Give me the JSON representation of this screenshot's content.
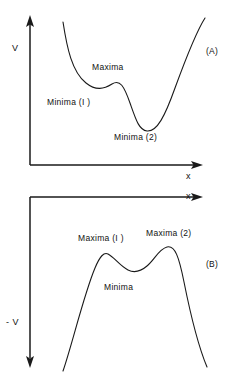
{
  "figure": {
    "background_color": "#ffffff",
    "ink_color": "#1a1a1a",
    "width": 234,
    "height": 378
  },
  "panels": [
    {
      "tag": "(A)",
      "tag_name": "panel-a-tag",
      "y_axis_label": "V",
      "x_axis_label": "x",
      "annotations": [
        {
          "text": "Maxima",
          "name": "panel-a-maxima-label"
        },
        {
          "text": "Minima (I )",
          "name": "panel-a-minima-1-label"
        },
        {
          "text": "Minima (2)",
          "name": "panel-a-minima-2-label"
        }
      ]
    },
    {
      "tag": "(B)",
      "tag_name": "panel-b-tag",
      "y_axis_label": "- V",
      "x_axis_label": "x",
      "annotations": [
        {
          "text": "Maxima (I )",
          "name": "panel-b-maxima-1-label"
        },
        {
          "text": "Maxima (2)",
          "name": "panel-b-maxima-2-label"
        },
        {
          "text": "Minima",
          "name": "panel-b-minima-label"
        }
      ]
    }
  ],
  "chart_data": {
    "type": "line",
    "title": "",
    "subtitle": "",
    "grid": false,
    "legend": false,
    "charts": [
      {
        "id": "panel-a",
        "tag": "(A)",
        "xlabel": "x",
        "ylabel": "V",
        "axis_origin": [
          30,
          165
        ],
        "x_axis_direction": "right",
        "y_axis_direction": "up",
        "description": "Double-well potential V(x): high at left, shallow first minimum, small local maximum, deep second minimum, high at right.",
        "features": [
          {
            "label": "Minima (I )",
            "kind": "local-minimum",
            "x": 95,
            "y": 87
          },
          {
            "label": "Maxima",
            "kind": "local-maximum",
            "x": 112,
            "y": 84
          },
          {
            "label": "Minima (2)",
            "kind": "global-minimum",
            "x": 144,
            "y": 131
          }
        ],
        "path": "M 63 22 C 67 48, 72 72, 86 83 C 96 91, 104 89, 112 84 C 120 79, 124 86, 130 103 C 136 120, 139 130, 147 131 C 157 132, 165 116, 175 88 C 186 58, 196 32, 205 18"
      },
      {
        "id": "panel-b",
        "tag": "(B)",
        "xlabel": "x",
        "ylabel": "- V",
        "axis_origin": [
          30,
          197
        ],
        "x_axis_direction": "right",
        "y_axis_direction": "down",
        "description": "Inverted double-well -V(x): rises from lower-left to first maximum, dips to a minimum, rises to a higher second maximum, then falls to lower-right.",
        "features": [
          {
            "label": "Maxima (I )",
            "kind": "local-maximum",
            "x": 105,
            "y": 253
          },
          {
            "label": "Minima",
            "kind": "local-minimum",
            "x": 134,
            "y": 271
          },
          {
            "label": "Maxima (2)",
            "kind": "global-maximum",
            "x": 166,
            "y": 248
          }
        ],
        "path": "M 63 371 C 72 345, 84 294, 95 268 C 100 256, 104 252, 108 254 C 114 257, 120 266, 128 270 C 134 273, 140 272, 147 266 C 155 259, 159 249, 167 247 C 175 245, 179 257, 184 282 C 190 312, 199 348, 207 367"
      }
    ]
  }
}
